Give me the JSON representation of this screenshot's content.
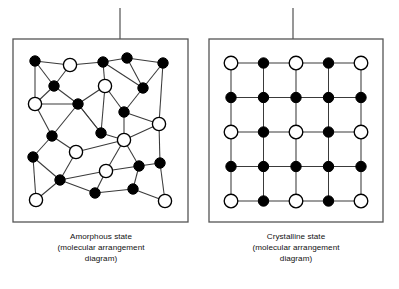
{
  "figure": {
    "background_color": "#ffffff",
    "line_color": "#3a3a3a",
    "node_stroke_color": "#000000",
    "node_fill_dark": "#000000",
    "node_fill_light": "#ffffff",
    "box_stroke_color": "#555555",
    "leader_line_color": "#6b6b6b"
  },
  "panels": [
    {
      "id": "amorphous",
      "caption_lines": [
        "Amorphous state",
        "(molecular arrangement",
        "diagram)"
      ],
      "caption_full": "Amorphous state (molecular arrangement diagram)",
      "box": {
        "x": 13,
        "y": 39,
        "width": 175,
        "height": 183
      },
      "leader_line": {
        "x": 120,
        "y1": 8,
        "y2": 39
      },
      "lattice_type": "disordered",
      "node_radius_dark": 5.2,
      "node_radius_light": 6.6,
      "nodes": [
        {
          "id": "a0",
          "x": 35,
          "y": 61,
          "type": "dark"
        },
        {
          "id": "a1",
          "x": 70,
          "y": 65,
          "type": "light"
        },
        {
          "id": "a2",
          "x": 103,
          "y": 62,
          "type": "dark"
        },
        {
          "id": "a3",
          "x": 127,
          "y": 58,
          "type": "dark"
        },
        {
          "id": "a4",
          "x": 163,
          "y": 63,
          "type": "dark"
        },
        {
          "id": "a5",
          "x": 54,
          "y": 86,
          "type": "dark"
        },
        {
          "id": "a6",
          "x": 105,
          "y": 86,
          "type": "light"
        },
        {
          "id": "a7",
          "x": 143,
          "y": 88,
          "type": "dark"
        },
        {
          "id": "a8",
          "x": 35,
          "y": 104,
          "type": "light"
        },
        {
          "id": "a9",
          "x": 78,
          "y": 104,
          "type": "dark"
        },
        {
          "id": "a10",
          "x": 124,
          "y": 112,
          "type": "dark"
        },
        {
          "id": "a11",
          "x": 159,
          "y": 124,
          "type": "light"
        },
        {
          "id": "a12",
          "x": 52,
          "y": 136,
          "type": "dark"
        },
        {
          "id": "a13",
          "x": 101,
          "y": 133,
          "type": "dark"
        },
        {
          "id": "a14",
          "x": 124,
          "y": 140,
          "type": "light"
        },
        {
          "id": "a15",
          "x": 76,
          "y": 152,
          "type": "light"
        },
        {
          "id": "a16",
          "x": 33,
          "y": 157,
          "type": "dark"
        },
        {
          "id": "a17",
          "x": 106,
          "y": 171,
          "type": "light"
        },
        {
          "id": "a18",
          "x": 139,
          "y": 166,
          "type": "dark"
        },
        {
          "id": "a19",
          "x": 160,
          "y": 163,
          "type": "dark"
        },
        {
          "id": "a20",
          "x": 60,
          "y": 180,
          "type": "dark"
        },
        {
          "id": "a21",
          "x": 95,
          "y": 193,
          "type": "dark"
        },
        {
          "id": "a22",
          "x": 133,
          "y": 189,
          "type": "dark"
        },
        {
          "id": "a23",
          "x": 36,
          "y": 200,
          "type": "light"
        },
        {
          "id": "a24",
          "x": 165,
          "y": 201,
          "type": "light"
        }
      ],
      "edges": [
        [
          "a0",
          "a1"
        ],
        [
          "a0",
          "a5"
        ],
        [
          "a0",
          "a8"
        ],
        [
          "a1",
          "a2"
        ],
        [
          "a1",
          "a5"
        ],
        [
          "a2",
          "a3"
        ],
        [
          "a2",
          "a6"
        ],
        [
          "a2",
          "a7"
        ],
        [
          "a3",
          "a4"
        ],
        [
          "a3",
          "a7"
        ],
        [
          "a4",
          "a7"
        ],
        [
          "a4",
          "a11"
        ],
        [
          "a5",
          "a8"
        ],
        [
          "a5",
          "a9"
        ],
        [
          "a6",
          "a9"
        ],
        [
          "a6",
          "a10"
        ],
        [
          "a6",
          "a13"
        ],
        [
          "a7",
          "a10"
        ],
        [
          "a8",
          "a9"
        ],
        [
          "a8",
          "a12"
        ],
        [
          "a9",
          "a12"
        ],
        [
          "a9",
          "a13"
        ],
        [
          "a10",
          "a11"
        ],
        [
          "a10",
          "a14"
        ],
        [
          "a11",
          "a19"
        ],
        [
          "a12",
          "a16"
        ],
        [
          "a12",
          "a15"
        ],
        [
          "a13",
          "a14"
        ],
        [
          "a13",
          "a9"
        ],
        [
          "a14",
          "a17"
        ],
        [
          "a14",
          "a18"
        ],
        [
          "a14",
          "a11"
        ],
        [
          "a15",
          "a20"
        ],
        [
          "a15",
          "a14"
        ],
        [
          "a16",
          "a23"
        ],
        [
          "a16",
          "a20"
        ],
        [
          "a17",
          "a18"
        ],
        [
          "a17",
          "a21"
        ],
        [
          "a17",
          "a20"
        ],
        [
          "a18",
          "a19"
        ],
        [
          "a18",
          "a22"
        ],
        [
          "a19",
          "a24"
        ],
        [
          "a20",
          "a21"
        ],
        [
          "a20",
          "a23"
        ],
        [
          "a21",
          "a22"
        ],
        [
          "a22",
          "a24"
        ]
      ]
    },
    {
      "id": "crystalline",
      "caption_lines": [
        "Crystalline state",
        "(molecular arrangement",
        "diagram)"
      ],
      "caption_full": "Crystalline state (molecular arrangement diagram)",
      "box": {
        "x": 209,
        "y": 39,
        "width": 174,
        "height": 183
      },
      "leader_line": {
        "x": 293,
        "y1": 8,
        "y2": 39
      },
      "lattice_type": "ordered-grid",
      "grid": {
        "rows": 5,
        "cols": 5,
        "x0": 231,
        "y0": 63,
        "dx": 32.5,
        "dy": 34.5
      },
      "node_radius_dark": 5.2,
      "node_radius_light": 6.8,
      "node_type_matrix": [
        [
          "light",
          "dark",
          "light",
          "dark",
          "light"
        ],
        [
          "dark",
          "dark",
          "dark",
          "dark",
          "dark"
        ],
        [
          "light",
          "dark",
          "light",
          "dark",
          "light"
        ],
        [
          "dark",
          "dark",
          "dark",
          "dark",
          "dark"
        ],
        [
          "light",
          "dark",
          "light",
          "dark",
          "light"
        ]
      ]
    }
  ]
}
